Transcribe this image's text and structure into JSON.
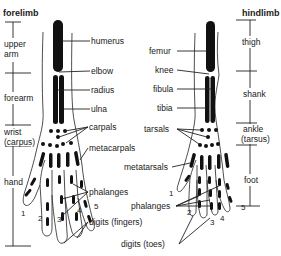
{
  "forelimb": {
    "title": "forelimb",
    "regions": [
      {
        "label": "upper",
        "label2": "arm"
      },
      {
        "label": "forearm"
      },
      {
        "label": "wrist",
        "label2": "(carpus)"
      },
      {
        "label": "hand"
      }
    ],
    "bones": {
      "humerus": "humerus",
      "elbow": "elbow",
      "radius": "radius",
      "ulna": "ulna",
      "carpals": "carpals",
      "metacarpals": "metacarpals",
      "phalanges": "phalanges",
      "digits": "digits (fingers)"
    },
    "digit_numbers": [
      "1",
      "2",
      "3",
      "4",
      "5"
    ]
  },
  "hindlimb": {
    "title": "hindlimb",
    "regions": [
      {
        "label": "thigh"
      },
      {
        "label": "shank"
      },
      {
        "label": "ankle",
        "label2": "(tarsus)"
      },
      {
        "label": "foot"
      }
    ],
    "bones": {
      "femur": "femur",
      "knee": "knee",
      "fibula": "fibula",
      "tibia": "tibia",
      "tarsals": "tarsals",
      "metatarsals": "metatarsals",
      "phalanges": "phalanges",
      "digits": "digits (toes)"
    },
    "digit_numbers": [
      "1",
      "2",
      "3",
      "4",
      "5"
    ]
  },
  "colors": {
    "ink": "#111111",
    "background": "#ffffff"
  }
}
